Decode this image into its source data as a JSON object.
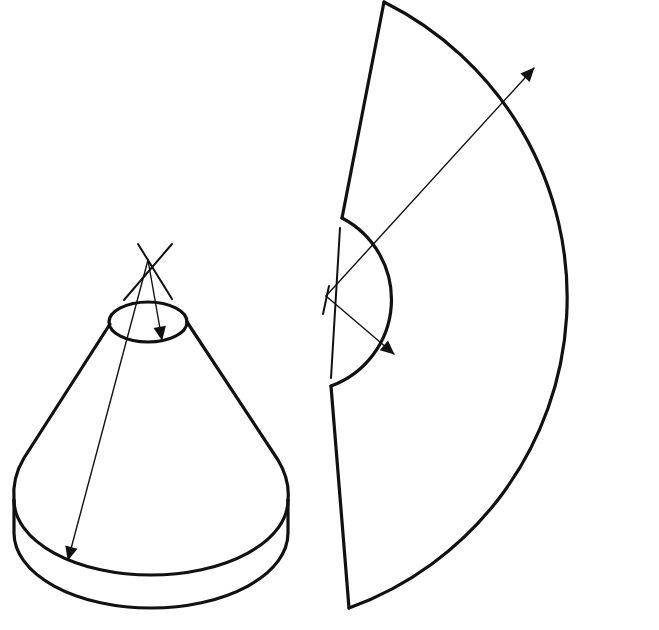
{
  "figure": {
    "title": "",
    "colors": {
      "background": "#ffffff",
      "ink": "#111111"
    },
    "width": 659,
    "height": 630
  },
  "cone": {
    "apex": [
      148,
      260
    ],
    "top_ellipse": {
      "cx": 148,
      "cy": 322,
      "rx": 40,
      "ry": 20
    },
    "base_ellipse": {
      "cx": 150,
      "cy": 500,
      "rx": 138,
      "ry": 76
    },
    "cylinder_bottom": {
      "cx": 150,
      "cy": 535,
      "rx": 138,
      "ry": 76
    },
    "slant_arrow_label": "",
    "top_arrow_label": ""
  },
  "development": {
    "center": [
      326,
      296
    ],
    "inner_radius": 90,
    "outer_radius": 320,
    "inner_arc_label": "",
    "outer_arc_label": ""
  }
}
